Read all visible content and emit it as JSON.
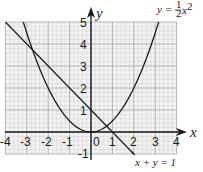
{
  "chart_data": {
    "type": "line",
    "title": "",
    "xlabel": "x",
    "ylabel": "y",
    "xlim": [
      -4,
      4
    ],
    "ylim": [
      -1,
      5
    ],
    "grid": true,
    "grid_minor_subdivisions": 5,
    "x_ticks": [
      "-4",
      "-3",
      "-2",
      "-1",
      "0",
      "1",
      "2",
      "3",
      "4"
    ],
    "y_ticks": [
      "-1",
      "1",
      "2",
      "3",
      "4",
      "5"
    ],
    "series": [
      {
        "name": "y = 1/2 x^2",
        "label_text": "y = ",
        "label_frac_num": "1",
        "label_frac_den": "2",
        "label_var": "x",
        "label_exp": "2",
        "function": "0.5*x^2",
        "x": [
          -3.16,
          -3,
          -2.5,
          -2,
          -1.5,
          -1,
          -0.5,
          0,
          0.5,
          1,
          1.5,
          2,
          2.5,
          3,
          3.16
        ],
        "y": [
          5,
          4.5,
          3.125,
          2,
          1.125,
          0.5,
          0.125,
          0,
          0.125,
          0.5,
          1.125,
          2,
          3.125,
          4.5,
          5
        ]
      },
      {
        "name": "x + y = 1",
        "label_text": "x + y = 1",
        "function": "1 - x",
        "x": [
          -4,
          2
        ],
        "y": [
          5,
          -1
        ]
      }
    ],
    "intersections": [
      {
        "x": -2.73,
        "y": 3.73
      },
      {
        "x": 0.73,
        "y": 0.27
      }
    ]
  },
  "labels": {
    "x_axis": "x",
    "y_axis": "y",
    "tick_x": [
      "-4",
      "-3",
      "-2",
      "-1",
      "0",
      "1",
      "2",
      "3",
      "4"
    ],
    "tick_y": [
      "5",
      "4",
      "3",
      "2",
      "1",
      "-1"
    ],
    "parabola_eq": {
      "lhs": "y =",
      "num": "1",
      "den": "2",
      "var": "x",
      "exp": "2"
    },
    "line_eq": "x + y = 1"
  }
}
